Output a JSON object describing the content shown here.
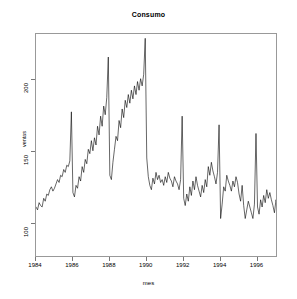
{
  "chart_data": {
    "type": "line",
    "title": "Consumo",
    "xlabel": "mes",
    "ylabel": "ventas",
    "xlim": [
      1984.0,
      1997.0
    ],
    "ylim": [
      78,
      232
    ],
    "grid": false,
    "legend": null,
    "x_ticks": [
      1984,
      1986,
      1988,
      1990,
      1992,
      1994,
      1996
    ],
    "y_ticks": [
      100,
      150,
      200
    ],
    "series": [
      {
        "name": "ventas",
        "x_start": 1984.0,
        "x_step": 0.08333,
        "values": [
          112,
          110,
          115,
          113,
          112,
          118,
          116,
          121,
          120,
          124,
          126,
          123,
          125,
          128,
          131,
          129,
          134,
          133,
          138,
          136,
          141,
          140,
          144,
          178,
          122,
          119,
          127,
          125,
          133,
          130,
          140,
          136,
          145,
          142,
          152,
          149,
          158,
          151,
          160,
          155,
          168,
          162,
          175,
          168,
          182,
          176,
          188,
          216,
          134,
          131,
          143,
          152,
          161,
          158,
          172,
          167,
          180,
          174,
          186,
          181,
          190,
          184,
          193,
          187,
          196,
          190,
          199,
          193,
          201,
          196,
          204,
          229,
          146,
          133,
          127,
          124,
          132,
          128,
          136,
          131,
          134,
          129,
          131,
          127,
          133,
          129,
          136,
          132,
          130,
          126,
          133,
          130,
          128,
          124,
          131,
          175,
          118,
          113,
          121,
          116,
          126,
          120,
          130,
          124,
          133,
          127,
          123,
          119,
          127,
          122,
          131,
          126,
          140,
          134,
          143,
          137,
          133,
          128,
          136,
          169,
          104,
          114,
          126,
          123,
          134,
          130,
          127,
          123,
          130,
          126,
          133,
          129,
          121,
          116,
          127,
          113,
          104,
          110,
          116,
          112,
          108,
          104,
          114,
          163,
          112,
          107,
          117,
          112,
          120,
          115,
          124,
          118,
          122,
          117,
          113,
          108,
          117,
          112,
          121,
          116,
          126,
          120,
          124,
          119,
          115,
          111,
          120,
          147,
          103,
          99,
          108,
          103,
          112,
          106,
          110,
          105,
          101,
          96,
          104,
          99,
          94,
          90,
          97,
          92,
          99,
          94,
          91,
          88,
          95,
          90,
          98,
          128,
          96,
          92,
          100,
          95,
          103,
          98,
          94,
          90,
          97,
          92,
          99,
          95,
          88,
          84,
          92,
          87,
          95,
          90,
          93,
          89,
          96,
          91,
          99,
          131,
          100,
          96,
          104,
          99,
          107,
          102,
          98,
          94,
          102,
          97,
          105,
          100,
          96,
          92,
          100,
          95,
          103,
          98,
          95,
          91,
          99,
          94,
          102,
          139,
          95,
          91,
          99,
          94,
          93,
          89,
          97,
          92,
          100,
          96,
          104,
          99,
          96,
          92,
          101,
          96,
          105,
          100,
          108,
          103,
          111,
          107,
          115,
          143,
          100,
          110,
          106,
          115,
          110,
          118,
          113,
          116,
          112,
          119,
          114,
          117,
          112,
          120,
          115,
          118,
          113,
          121,
          116,
          124,
          119,
          122,
          118,
          141,
          97,
          93,
          102,
          110,
          105,
          113,
          108,
          116,
          111,
          107,
          103,
          111,
          106,
          114,
          109,
          117,
          112,
          120,
          115,
          118,
          114,
          121,
          117,
          120
        ]
      }
    ]
  },
  "axes": {
    "y_tick_labels": [
      "200",
      "150",
      "100"
    ],
    "x_tick_labels": [
      "1984",
      "1986",
      "1988",
      "1990",
      "1992",
      "1994",
      "1996"
    ]
  },
  "style": {
    "line_color": "#000000",
    "frame_color": "#999999",
    "background": "#ffffff"
  }
}
